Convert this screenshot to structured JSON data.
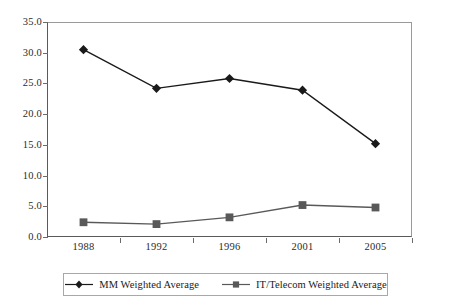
{
  "chart_data": {
    "type": "line",
    "title": "",
    "subtitle": "",
    "xlabel": "",
    "ylabel": "",
    "categories": [
      "1988",
      "1992",
      "1996",
      "2001",
      "2005"
    ],
    "series": [
      {
        "name": "MM Weighted Average",
        "marker": "diamond",
        "color": "#1a1a1a",
        "values": [
          30.5,
          24.2,
          25.8,
          23.9,
          15.2
        ]
      },
      {
        "name": "IT/Telecom Weighted Average",
        "marker": "square",
        "color": "#595959",
        "values": [
          2.4,
          2.1,
          3.2,
          5.2,
          4.8
        ]
      }
    ],
    "ylim": [
      0.0,
      35.0
    ],
    "ytick_step": 5.0,
    "ytick_labels": [
      "0.0",
      "5.0",
      "10.0",
      "15.0",
      "20.0",
      "25.0",
      "30.0",
      "35.0"
    ],
    "grid": false,
    "legend_position": "bottom"
  },
  "legend": {
    "entries": [
      {
        "label": "MM Weighted Average",
        "icon": "diamond-marker-icon"
      },
      {
        "label": "IT/Telecom Weighted Average",
        "icon": "square-marker-icon"
      }
    ]
  },
  "colors": {
    "series_1": "#1a1a1a",
    "series_2": "#595959",
    "axis": "#5a5a5a",
    "frame": "#9a9a9a",
    "background": "#ffffff"
  }
}
